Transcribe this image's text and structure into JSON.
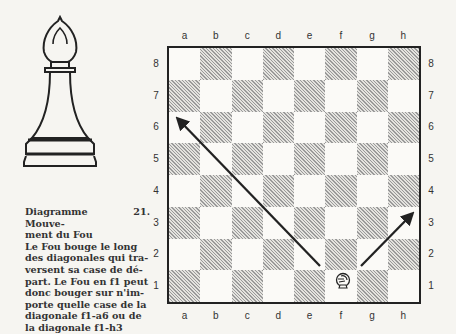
{
  "caption": {
    "lines": [
      "Diagramme 21. Mouve-",
      "ment du Fou",
      "Le Fou bouge le long",
      "des diagonales qui tra-",
      "versent sa case de dé-",
      "part. Le Fou en f1 peut",
      "donc bouger sur n'im-",
      "porte quelle case de la",
      "diagonale f1-a6 ou de",
      "la diagonale f1-h3"
    ]
  },
  "board": {
    "files": [
      "a",
      "b",
      "c",
      "d",
      "e",
      "f",
      "g",
      "h"
    ],
    "ranks": [
      "8",
      "7",
      "6",
      "5",
      "4",
      "3",
      "2",
      "1"
    ],
    "top_left_square_color": "light",
    "pieces": [
      {
        "square": "f1",
        "piece": "bishop-icon"
      }
    ],
    "arrows": [
      {
        "from": "f1",
        "to": "a6"
      },
      {
        "from": "f1",
        "to": "h3"
      }
    ]
  },
  "figure": {
    "piece_illustration": "bishop-icon"
  }
}
